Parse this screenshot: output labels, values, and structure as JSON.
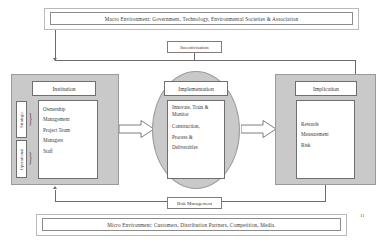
{
  "diagram": {
    "page_number": "11",
    "macro_banner": {
      "text": "Macro Environment: Government, Technology, Environmental Societies & Association"
    },
    "micro_banner": {
      "text": "Micro Environment: Customers, Distribution Partners, Competition, Media."
    },
    "incentivisation": {
      "label": "Incentivisation"
    },
    "risk_management": {
      "label": "Risk Management"
    },
    "institution": {
      "title": "Institution",
      "side_labels": [
        {
          "label": "Strategic"
        },
        {
          "label": "Operational"
        }
      ],
      "items": [
        {
          "label": "Ownership"
        },
        {
          "label": "Management"
        },
        {
          "label": "Project Team"
        },
        {
          "label": "Managers"
        },
        {
          "label": "Staff"
        }
      ]
    },
    "implementation": {
      "title": "Implementation",
      "items": [
        {
          "label": "Innovate, Train & Monitor"
        },
        {
          "label": "Construction,"
        },
        {
          "label": "Process &"
        },
        {
          "label": "Deliverables"
        }
      ]
    },
    "implication": {
      "title": "Implication",
      "items": [
        {
          "label": "Rewards"
        },
        {
          "label": "Measurement"
        },
        {
          "label": "Risk"
        }
      ]
    },
    "colors": {
      "panel_fill": "#c9c9c9",
      "panel_border": "#9a9a9a",
      "box_border": "#6f6f6f",
      "line": "#6b6b6b",
      "text": "#3a3a3a",
      "background": "#ffffff"
    }
  }
}
